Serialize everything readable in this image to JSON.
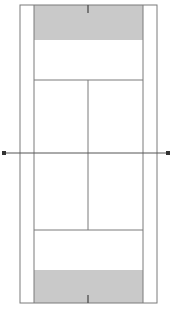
{
  "figure": {
    "type": "diagram",
    "width": 173,
    "height": 310,
    "background_color": "#ffffff"
  },
  "colors": {
    "line": "#7a7a7a",
    "line_dark": "#555555",
    "surface": "#ffffff",
    "shaded_zone": "#c9c9c9",
    "net_line": "#555555",
    "net_endpoint": "#333333"
  },
  "geometry": {
    "doubles_court": {
      "left": 20,
      "right": 157,
      "top": 5,
      "bottom": 303
    },
    "singles_sidelines": {
      "left_x": 34,
      "right_x": 143
    },
    "service_lines": {
      "near_y": 230,
      "far_y": 80
    },
    "center_service_line_x": 88,
    "net_line_y": 153,
    "net_endpoints": [
      {
        "x": 4,
        "y": 153
      },
      {
        "x": 168,
        "y": 153
      }
    ],
    "center_marks": [
      {
        "x": 88,
        "y_start": 5,
        "y_end": 13
      },
      {
        "x": 88,
        "y_start": 295,
        "y_end": 303
      }
    ],
    "shaded_zones": [
      {
        "x": 34,
        "y": 5,
        "width": 109,
        "height": 35,
        "label": "far-baseline-zone"
      },
      {
        "x": 34,
        "y": 270,
        "width": 109,
        "height": 33,
        "label": "near-baseline-zone"
      }
    ]
  },
  "elements": {
    "outer_boundary_label": "doubles-sideline-boundary",
    "left_alley_label": "left-doubles-alley",
    "right_alley_label": "right-doubles-alley",
    "far_service_box_left_label": "far-left-service-box",
    "far_service_box_right_label": "far-right-service-box",
    "near_service_box_left_label": "near-left-service-box",
    "near_service_box_right_label": "near-right-service-box",
    "net_label": "net-line",
    "far_backcourt_label": "far-backcourt",
    "near_backcourt_label": "near-backcourt"
  },
  "stroke_widths": {
    "boundary": 1,
    "inner": 1,
    "net": 1,
    "center_mark": 1.4
  }
}
